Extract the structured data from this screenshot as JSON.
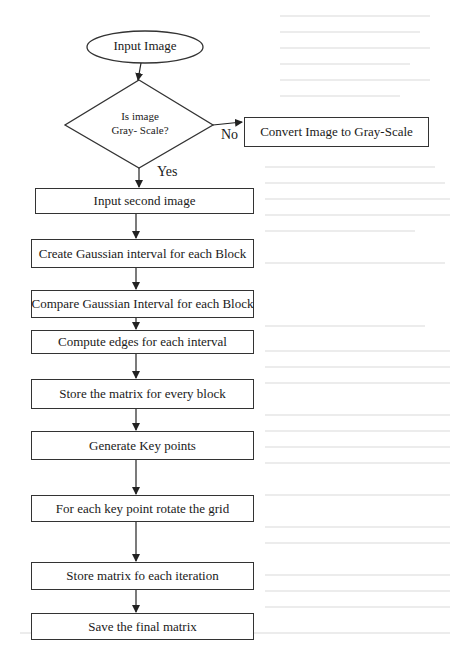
{
  "flowchart": {
    "start": {
      "label": "Input Image",
      "shape": "ellipse"
    },
    "decision": {
      "line1": "Is image",
      "line2": "Gray- Scale?",
      "shape": "diamond"
    },
    "branch_no": {
      "label": "No",
      "target": "Convert Image to Gray-Scale"
    },
    "branch_yes": {
      "label": "Yes"
    },
    "side_box": {
      "label": "Convert Image to Gray-Scale"
    },
    "steps": [
      {
        "label": "Input second image"
      },
      {
        "label": "Create Gaussian interval for each Block"
      },
      {
        "label": "Compare Gaussian Interval for each Block"
      },
      {
        "label": "Compute edges for each interval"
      },
      {
        "label": "Store the matrix for every block"
      },
      {
        "label": "Generate Key points"
      },
      {
        "label": "For each key point rotate the grid"
      },
      {
        "label": "Store matrix fo each iteration"
      },
      {
        "label": "Save the final matrix"
      }
    ]
  },
  "colors": {
    "stroke": "#333333",
    "text": "#1a1a1a",
    "background": "#ffffff",
    "bleed_through_text": "#ececec"
  }
}
